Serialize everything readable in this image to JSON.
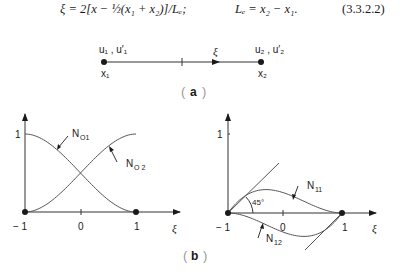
{
  "equation": {
    "lhs": "ξ = 2[x − ½(x₁ + x₂)]/Lₑ;",
    "rhs": "Lₑ = x₂ − x₁.",
    "number": "(3.3.2.2)"
  },
  "figure_a": {
    "caption": "a",
    "node1_dofs": "u₁ , u′₁",
    "node2_dofs": "u₂ , u′₂",
    "node1_label": "x₁",
    "node2_label": "x₂",
    "axis_label": "ξ"
  },
  "figure_b": {
    "caption": "b",
    "left_plot": {
      "y_tick": "1",
      "x_ticks": [
        "− 1",
        "0",
        "1"
      ],
      "x_label": "ξ",
      "curves": [
        {
          "name": "N01",
          "label": "N",
          "sub": "O1"
        },
        {
          "name": "N02",
          "label": "N",
          "sub": "O 2"
        }
      ]
    },
    "right_plot": {
      "y_tick": "1",
      "x_ticks": [
        "− 1",
        "0",
        "1"
      ],
      "x_label": "ξ",
      "angle_label": "45°",
      "curves": [
        {
          "name": "N11",
          "label": "N",
          "sub": "11"
        },
        {
          "name": "N12",
          "label": "N",
          "sub": "12"
        }
      ]
    }
  },
  "colors": {
    "ink": "#1a1a1a",
    "curve": "#555555"
  }
}
